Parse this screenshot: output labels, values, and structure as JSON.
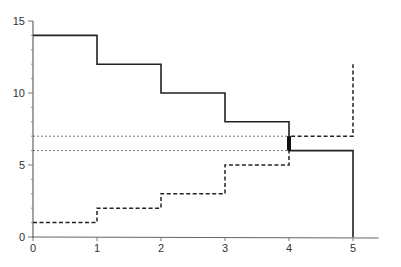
{
  "chart_data": {
    "type": "line",
    "step": true,
    "title": "",
    "xlabel": "",
    "ylabel": "",
    "xlim": [
      0,
      5.4
    ],
    "ylim": [
      0,
      15
    ],
    "x_ticks": [
      "0",
      "1",
      "2",
      "3",
      "4",
      "5"
    ],
    "y_ticks": [
      "0",
      "5",
      "10",
      "15"
    ],
    "grid": false,
    "series": [
      {
        "name": "decreasing (solid)",
        "style": "solid",
        "x": [
          0,
          1,
          2,
          3,
          4,
          5
        ],
        "values": [
          14,
          12,
          10,
          8,
          6,
          0
        ]
      },
      {
        "name": "increasing (dashed)",
        "style": "dashed",
        "x": [
          0,
          1,
          2,
          3,
          4,
          5
        ],
        "values": [
          1,
          2,
          3,
          5,
          7,
          12
        ]
      }
    ],
    "reference_lines": [
      {
        "type": "horizontal",
        "y": 7,
        "style": "dotted",
        "x_range": [
          0,
          4
        ]
      },
      {
        "type": "horizontal",
        "y": 6,
        "style": "dotted",
        "x_range": [
          0,
          4
        ]
      }
    ],
    "annotations": [
      {
        "type": "thick-segment",
        "x": 4,
        "y_range": [
          6,
          7
        ],
        "note": "gap between curves at x=4"
      }
    ]
  }
}
